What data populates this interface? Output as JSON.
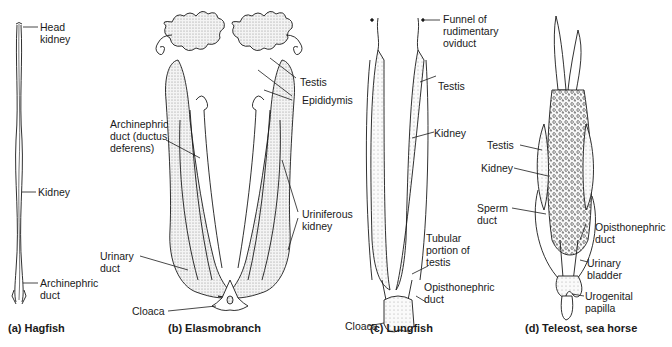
{
  "panels": [
    {
      "id": "a",
      "caption": "(a) Hagfish",
      "labels": [
        {
          "text": "Head\nkidney"
        },
        {
          "text": "Kidney"
        },
        {
          "text": "Archinephric\nduct"
        }
      ]
    },
    {
      "id": "b",
      "caption": "(b) Elasmobranch",
      "labels": [
        {
          "text": "Testis"
        },
        {
          "text": "Epididymis"
        },
        {
          "text": "Archinephric\nduct (ductus\ndeferens)"
        },
        {
          "text": "Uriniferous\nkidney"
        },
        {
          "text": "Urinary\nduct"
        },
        {
          "text": "Cloaca"
        }
      ]
    },
    {
      "id": "c",
      "caption": "(c) Lungfish",
      "labels": [
        {
          "text": "Funnel of\nrudimentary\noviduct"
        },
        {
          "text": "Testis"
        },
        {
          "text": "Kidney"
        },
        {
          "text": "Tubular\nportion of\ntestis"
        },
        {
          "text": "Opisthonephric\nduct"
        },
        {
          "text": "Cloaca"
        }
      ]
    },
    {
      "id": "d",
      "caption": "(d) Teleost, sea horse",
      "labels": [
        {
          "text": "Testis"
        },
        {
          "text": "Kidney"
        },
        {
          "text": "Sperm\nduct"
        },
        {
          "text": "Opisthonephric\nduct"
        },
        {
          "text": "Urinary\nbladder"
        },
        {
          "text": "Urogenital\npapilla"
        }
      ]
    }
  ],
  "colors": {
    "ink": "#1a1a1a",
    "stipple": "#bdbdbd",
    "background": "#ffffff"
  }
}
